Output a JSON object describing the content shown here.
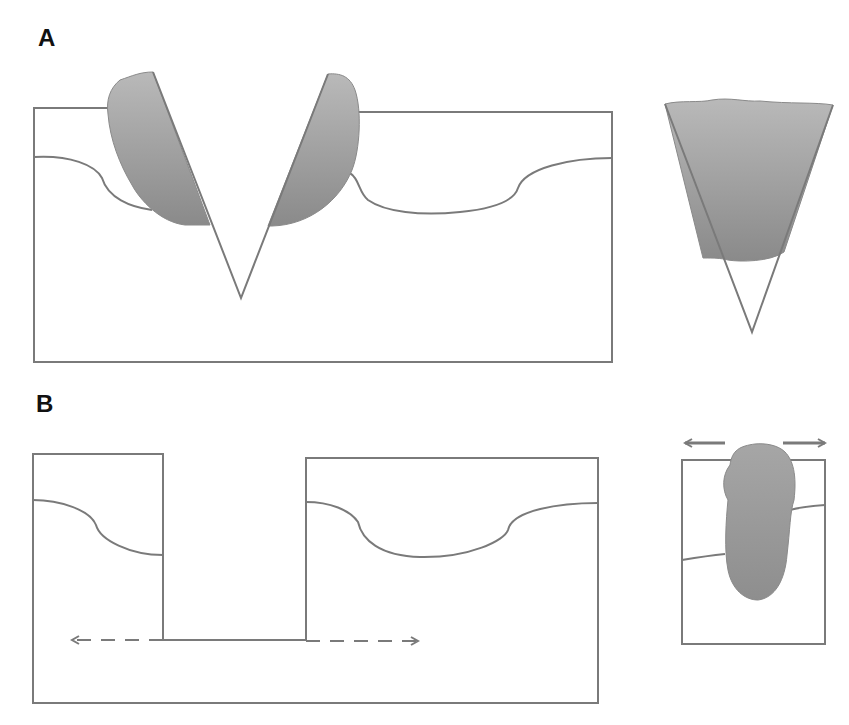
{
  "figure": {
    "panels": [
      {
        "label": "A",
        "description": "V-shaped notch cut into tissue block with shaded wedge-shaped mass on both notch walls; inset shows inverted triangle filled with shaded mass"
      },
      {
        "label": "B",
        "description": "Rectangular gap cut into tissue block with dashed bidirectional arrows along the gap base; inset shows block with shaded oblong mass and outward arrows"
      }
    ],
    "colors": {
      "line": "#7a7a7a",
      "fill_light": "#b4b4b4",
      "fill_dark": "#8e8e8e",
      "background": "#ffffff",
      "label": "#111111"
    },
    "arrows": {
      "panel_b_main": "dashed-bidirectional-horizontal",
      "panel_b_inset": "solid-outward-horizontal"
    }
  }
}
